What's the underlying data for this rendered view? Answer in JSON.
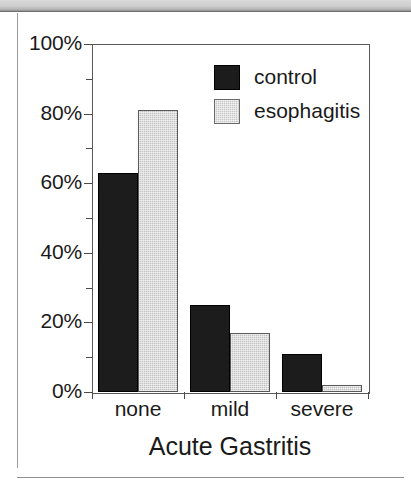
{
  "chart_data": {
    "type": "bar",
    "title": "",
    "xlabel": "Acute Gastritis",
    "ylabel": "",
    "categories": [
      "none",
      "mild",
      "severe"
    ],
    "series": [
      {
        "name": "control",
        "color": "#1c1c1c",
        "values": [
          63,
          25,
          11
        ]
      },
      {
        "name": "esophagitis",
        "color": "#c2c2c2",
        "values": [
          81,
          17,
          2
        ]
      }
    ],
    "ylim": [
      0,
      100
    ],
    "ytick_labels": [
      "0%",
      "20%",
      "40%",
      "60%",
      "80%",
      "100%"
    ],
    "ytick_values": [
      0,
      20,
      40,
      60,
      80,
      100
    ],
    "yminor_values": [
      10,
      30,
      50,
      70,
      90
    ],
    "grid": false,
    "legend_position": "top-right",
    "value_suffix": "%"
  },
  "legend": {
    "entries": [
      {
        "label": "control"
      },
      {
        "label": "esophagitis"
      }
    ]
  },
  "axis": {
    "x_title": "Acute Gastritis"
  }
}
